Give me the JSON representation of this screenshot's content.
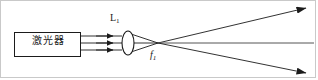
{
  "figure": {
    "type": "optical-ray-diagram",
    "background_color": "#ffffff",
    "line_color": "#1b1b1b",
    "frame_color": "#c9c9c9",
    "width": 318,
    "height": 80
  },
  "source": {
    "label": "激光器",
    "box": {
      "x": 14,
      "y": 32,
      "width": 66,
      "height": 24
    }
  },
  "lens": {
    "label_text": "L",
    "label_sub": "1",
    "center_x": 128,
    "center_y": 43,
    "half_width": 6,
    "half_height": 12
  },
  "focus": {
    "label_text": "f",
    "label_sub": "1",
    "x": 158,
    "y": 43
  },
  "beams": {
    "incident_count": 3,
    "incident_y": [
      36,
      43,
      50
    ],
    "incident_start_x": 80,
    "incident_end_x": 122,
    "arrow_x": 112
  },
  "rays_out": [
    {
      "name": "upper-diverging-ray",
      "x1": 158,
      "y1": 43,
      "x2": 308,
      "y2": 7
    },
    {
      "name": "axis-ray",
      "x1": 158,
      "y1": 43,
      "x2": 314,
      "y2": 43
    },
    {
      "name": "lower-diverging-ray",
      "x1": 158,
      "y1": 43,
      "x2": 308,
      "y2": 74
    }
  ]
}
